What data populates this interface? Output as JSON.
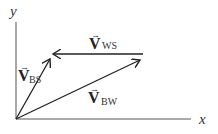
{
  "diagram": {
    "type": "vector-addition",
    "axes": {
      "x_label": "x",
      "y_label": "y"
    },
    "vectors": [
      {
        "id": "bs",
        "symbol": "V",
        "subscript": "BS",
        "from": [
          16,
          119
        ],
        "to": [
          50,
          59
        ]
      },
      {
        "id": "ws",
        "symbol": "V",
        "subscript": "WS",
        "from": [
          143,
          54
        ],
        "to": [
          52,
          54
        ]
      },
      {
        "id": "bw",
        "symbol": "V",
        "subscript": "BW",
        "from": [
          16,
          119
        ],
        "to": [
          141,
          59
        ]
      }
    ],
    "colors": {
      "line": "#222222",
      "background": "#ffffff"
    }
  }
}
